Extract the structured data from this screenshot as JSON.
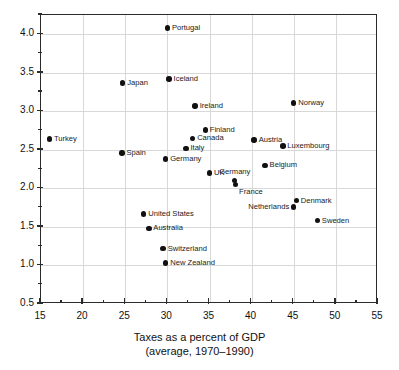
{
  "chart_data": {
    "type": "scatter",
    "title": "",
    "xlabel": "Taxes as a percent of GDP",
    "xlabel_line2": "(average, 1970–1990)",
    "ylabel": "",
    "xlim": [
      15,
      55
    ],
    "ylim": [
      0.5,
      4.25
    ],
    "xticks": [
      15,
      20,
      25,
      30,
      35,
      40,
      45,
      50,
      55
    ],
    "xtick_labels": [
      "15",
      "20",
      "25",
      "30",
      "35",
      "40",
      "45",
      "50",
      "55"
    ],
    "xticks_minor": [
      17.5,
      22.5,
      27.5,
      32.5,
      37.5,
      42.5,
      47.5,
      52.5
    ],
    "yticks": [
      0.5,
      1.0,
      1.5,
      2.0,
      2.5,
      3.0,
      3.5,
      4.0
    ],
    "ytick_labels": [
      "0.5",
      "1.0",
      "1.5",
      "2.0",
      "2.5",
      "3.0",
      "3.5",
      "4.0"
    ],
    "yticks_minor": [
      0.75,
      1.25,
      1.75,
      2.25,
      2.75,
      3.25,
      3.75,
      4.25
    ],
    "grid": true,
    "legend": null,
    "marker_color": "#111111",
    "grid_color": "#d8d8d8",
    "axis_color": "#2b2b2b",
    "points": [
      {
        "label": "Turkey",
        "x": 16.0,
        "y": 2.64,
        "pos": "right"
      },
      {
        "label": "Portugal",
        "x": 30.0,
        "y": 4.08,
        "pos": "right"
      },
      {
        "label": "Japan",
        "x": 24.7,
        "y": 3.37,
        "pos": "right"
      },
      {
        "label": "Iceland",
        "x": 30.2,
        "y": 3.42,
        "pos": "right"
      },
      {
        "label": "Ireland",
        "x": 33.3,
        "y": 3.07,
        "pos": "right"
      },
      {
        "label": "Norway",
        "x": 45.0,
        "y": 3.11,
        "pos": "right"
      },
      {
        "label": "Finland",
        "x": 34.5,
        "y": 2.76,
        "pos": "right"
      },
      {
        "label": "Canada",
        "x": 33.0,
        "y": 2.65,
        "pos": "right"
      },
      {
        "label": "Austria",
        "x": 40.3,
        "y": 2.63,
        "pos": "right"
      },
      {
        "label": "Luxembourg",
        "x": 43.7,
        "y": 2.55,
        "pos": "right"
      },
      {
        "label": "Italy",
        "x": 32.2,
        "y": 2.52,
        "pos": "right"
      },
      {
        "label": "Spain",
        "x": 24.6,
        "y": 2.46,
        "pos": "right"
      },
      {
        "label": "Germany",
        "x": 29.8,
        "y": 2.38,
        "pos": "right"
      },
      {
        "label": "Belgium",
        "x": 41.6,
        "y": 2.3,
        "pos": "right"
      },
      {
        "label": "UK",
        "x": 35.0,
        "y": 2.2,
        "pos": "right"
      },
      {
        "label": "Germany",
        "x": 38.0,
        "y": 2.1,
        "pos": "above"
      },
      {
        "label": "France",
        "x": 38.1,
        "y": 2.05,
        "pos": "below-right"
      },
      {
        "label": "Denmark",
        "x": 45.3,
        "y": 1.84,
        "pos": "right"
      },
      {
        "label": "Netherlands",
        "x": 45.0,
        "y": 1.76,
        "pos": "left"
      },
      {
        "label": "United States",
        "x": 27.2,
        "y": 1.67,
        "pos": "right"
      },
      {
        "label": "Sweden",
        "x": 47.8,
        "y": 1.58,
        "pos": "right"
      },
      {
        "label": "Australia",
        "x": 27.8,
        "y": 1.48,
        "pos": "right"
      },
      {
        "label": "Switzerland",
        "x": 29.5,
        "y": 1.22,
        "pos": "right"
      },
      {
        "label": "New Zealand",
        "x": 29.8,
        "y": 1.03,
        "pos": "right"
      }
    ]
  }
}
